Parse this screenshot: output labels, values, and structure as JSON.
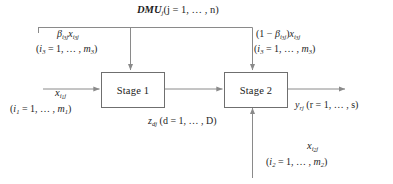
{
  "diagram": {
    "title_label": "DMU",
    "title_sub": "j",
    "title_range": "(j = 1, … , n)",
    "nodes": [
      {
        "id": "stage1",
        "label": "Stage 1"
      },
      {
        "id": "stage2",
        "label": "Stage 2"
      }
    ],
    "labels": {
      "beta_numerator": {
        "beta": "β",
        "beta_sub": "i",
        "beta_sub_sub": "3",
        "beta_sub_tail": "j",
        "x": "x",
        "x_sub": "i",
        "x_sub_sub": "3",
        "x_sub_tail": "j"
      },
      "beta_range": {
        "open": "(",
        "i": "i",
        "i_sub": "3",
        "eq": " = 1, … , ",
        "m": "m",
        "m_sub": "3",
        "close": ")"
      },
      "one_minus_beta": {
        "prefix": "(1 − ",
        "beta": "β",
        "beta_sub": "i",
        "beta_sub_sub": "3",
        "beta_sub_tail": "j",
        "mid": ")",
        "x": "x",
        "x_sub": "i",
        "x_sub_sub": "3",
        "x_sub_tail": "j"
      },
      "one_minus_beta_range": {
        "open": "(",
        "i": "i",
        "i_sub": "3",
        "eq": " = 1, … , ",
        "m": "m",
        "m_sub": "3",
        "close": ")"
      },
      "input_x1": {
        "x": "x",
        "x_sub": "i",
        "x_sub_sub": "1",
        "x_sub_tail": "j"
      },
      "input_x1_range": {
        "open": "(",
        "i": "i",
        "i_sub": "1",
        "eq": " = 1, … , ",
        "m": "m",
        "m_sub": "1",
        "close": ")"
      },
      "intermediate_z": {
        "z": "z",
        "z_sub": "dj",
        "range": " (d = 1, … , D)"
      },
      "output_y": {
        "y": "y",
        "y_sub": "rj",
        "range": " (r = 1, … , s)"
      },
      "input_x2": {
        "x": "x",
        "x_sub": "i",
        "x_sub_sub": "2",
        "x_sub_tail": "j"
      },
      "input_x2_range": {
        "open": "(",
        "i": "i",
        "i_sub": "2",
        "eq": " = 1, … , ",
        "m": "m",
        "m_sub": "2",
        "close": ")"
      }
    },
    "colors": {
      "line": "#8a8a8a",
      "box_border": "#6f6f6f",
      "text": "#1b1b1b",
      "background": "#ffffff"
    }
  }
}
